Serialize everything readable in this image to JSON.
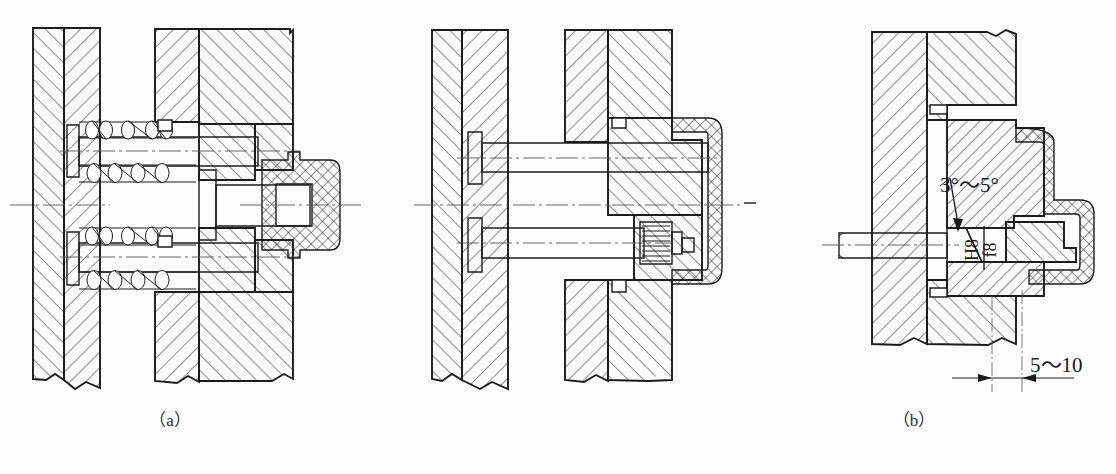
{
  "figure": {
    "kind": "engineering-sectional-drawing",
    "panel_count": 3,
    "line_color": "#1c1c1c",
    "background_color": "#fdfdfd"
  },
  "panels": [
    {
      "id": "a",
      "caption": "（a）",
      "description": "Spring-loaded ejector pin assembly section",
      "annotations": []
    },
    {
      "id": "b",
      "caption": "（b）",
      "description": "Screw-retained ejector assembly section",
      "annotations": []
    },
    {
      "id": "c",
      "caption": "（c）",
      "description": "Detail section with taper and fit callouts",
      "annotations": [
        {
          "name": "taper-angle",
          "text": "3°～5°"
        },
        {
          "name": "fit-tolerance-upper",
          "text": "H8"
        },
        {
          "name": "fit-tolerance-lower",
          "text": "f8"
        },
        {
          "name": "clearance-dimension",
          "text": "5～10"
        }
      ]
    }
  ],
  "callouts": {
    "taper_angle": "3°～5°",
    "fit_upper": "H8",
    "fit_lower": "f8",
    "clearance": "5～10"
  }
}
